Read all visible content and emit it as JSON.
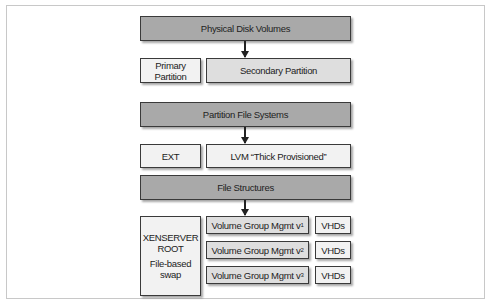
{
  "diagram": {
    "layers": [
      {
        "header": "Physical Disk Volumes",
        "children": [
          "Primary Partition",
          "Secondary Partition"
        ]
      },
      {
        "header": "Partition File Systems",
        "children": [
          "EXT",
          "LVM “Thick Provisioned”"
        ]
      },
      {
        "header": "File Structures",
        "children": []
      }
    ],
    "primary_partition": {
      "line1": "Primary",
      "line2": "Partition"
    },
    "secondary_partition": "Secondary Partition",
    "ext": "EXT",
    "lvm": "LVM “Thick Provisioned”",
    "xenserver": {
      "line1": "XENSERVER",
      "line2": "ROOT",
      "line3": "File-based",
      "line4": "swap"
    },
    "volume_groups": [
      {
        "label": "Volume Group Mgmt v",
        "sup": "1",
        "vhd": "VHDs"
      },
      {
        "label": "Volume Group Mgmt v",
        "sup": "2",
        "vhd": "VHDs"
      },
      {
        "label": "Volume Group Mgmt v",
        "sup": "3",
        "vhd": "VHDs"
      }
    ],
    "colors": {
      "header_fill": "#a9a9a9",
      "secondary_fill": "#dedede",
      "light_fill": "#f2f2f2",
      "border": "#3a3a3a"
    }
  }
}
